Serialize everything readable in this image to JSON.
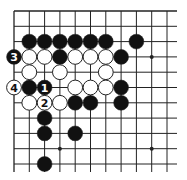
{
  "diagram": {
    "type": "go-board-fragment",
    "corner": "top-left",
    "grid": {
      "columns": 11,
      "rows": 11,
      "origin_x": 14,
      "origin_y": 11,
      "spacing": 15.3,
      "line_color": "#222222",
      "right_overhang": 10,
      "bottom_overhang": 8
    },
    "colors": {
      "black_stone": "#111111",
      "white_stone": "#ffffff",
      "stone_outline": "#222222",
      "background": "#ffffff"
    },
    "star_points": [
      {
        "col": 3,
        "row": 9
      },
      {
        "col": 9,
        "row": 3
      },
      {
        "col": 9,
        "row": 9
      }
    ],
    "black_stones": [
      {
        "col": 1,
        "row": 2
      },
      {
        "col": 2,
        "row": 2
      },
      {
        "col": 3,
        "row": 2
      },
      {
        "col": 4,
        "row": 2
      },
      {
        "col": 5,
        "row": 2
      },
      {
        "col": 6,
        "row": 2
      },
      {
        "col": 8,
        "row": 2
      },
      {
        "col": 0,
        "row": 3,
        "label": "3"
      },
      {
        "col": 3,
        "row": 3
      },
      {
        "col": 7,
        "row": 3
      },
      {
        "col": 1,
        "row": 5
      },
      {
        "col": 2,
        "row": 5,
        "label": "1"
      },
      {
        "col": 7,
        "row": 5
      },
      {
        "col": 4,
        "row": 6
      },
      {
        "col": 5,
        "row": 6
      },
      {
        "col": 7,
        "row": 6
      },
      {
        "col": 2,
        "row": 7
      },
      {
        "col": 2,
        "row": 8
      },
      {
        "col": 4,
        "row": 8
      },
      {
        "col": 2,
        "row": 10
      }
    ],
    "white_stones": [
      {
        "col": 1,
        "row": 3
      },
      {
        "col": 2,
        "row": 3
      },
      {
        "col": 4,
        "row": 3
      },
      {
        "col": 5,
        "row": 3
      },
      {
        "col": 6,
        "row": 3
      },
      {
        "col": 1,
        "row": 4
      },
      {
        "col": 3,
        "row": 4
      },
      {
        "col": 6,
        "row": 4
      },
      {
        "col": 0,
        "row": 5,
        "label": "4"
      },
      {
        "col": 4,
        "row": 5
      },
      {
        "col": 5,
        "row": 5
      },
      {
        "col": 6,
        "row": 5
      },
      {
        "col": 1,
        "row": 6
      },
      {
        "col": 2,
        "row": 6,
        "label": "2"
      },
      {
        "col": 3,
        "row": 6
      }
    ],
    "move_labels": [
      "1",
      "2",
      "3",
      "4"
    ]
  }
}
